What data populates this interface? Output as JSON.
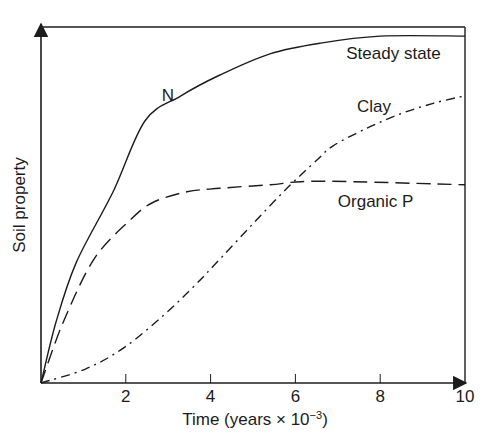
{
  "chart_data": {
    "type": "line",
    "title": "",
    "xlabel": "Time (years × 10⁻³)",
    "xlabel_parts": {
      "main": "Time (years × 10",
      "exp": "−3",
      "close": ")"
    },
    "ylabel": "Soil property",
    "xlim": [
      0,
      10
    ],
    "ylim": [
      0,
      100
    ],
    "y_units": "relative (no tick labels shown)",
    "x_ticks": [
      2,
      4,
      6,
      8,
      10
    ],
    "x_tick_labels": [
      "2",
      "4",
      "6",
      "8",
      "10"
    ],
    "grid": false,
    "legend": "inline labels",
    "annotations": [
      {
        "text": "Steady state",
        "x": 7.2,
        "y": 93
      },
      {
        "text": "N",
        "x": 2.85,
        "y": 81
      },
      {
        "text": "Clay",
        "x": 7.45,
        "y": 78
      },
      {
        "text": "Organic P",
        "x": 7.0,
        "y": 51
      }
    ],
    "series": [
      {
        "name": "N",
        "style": "solid",
        "x": [
          0,
          0.35,
          0.83,
          1.7,
          2.45,
          3.28,
          4.22,
          5.4,
          6.58,
          8.0,
          10.0
        ],
        "y": [
          0,
          17,
          34,
          54,
          74,
          81,
          87,
          93,
          96,
          98,
          98
        ]
      },
      {
        "name": "Clay",
        "style": "dash-dot",
        "x": [
          0,
          1.06,
          1.96,
          2.88,
          3.58,
          4.22,
          5.0,
          5.8,
          6.51,
          6.89,
          7.69,
          8.47,
          9.25,
          9.95
        ],
        "y": [
          0,
          4,
          10,
          19,
          27,
          35,
          45,
          55,
          63,
          67,
          72,
          76,
          79,
          81
        ]
      },
      {
        "name": "Organic P",
        "style": "dashed",
        "x": [
          0,
          0.52,
          1.25,
          2.1,
          2.64,
          3.44,
          4.22,
          5.4,
          6.58,
          10.0
        ],
        "y": [
          0,
          17,
          35,
          46,
          51,
          54,
          55,
          56,
          57,
          56
        ]
      }
    ],
    "steady_state_line": {
      "y": 100,
      "label": "Steady state"
    }
  },
  "colors": {
    "ink": "#1c1c1c",
    "background": "#ffffff"
  }
}
